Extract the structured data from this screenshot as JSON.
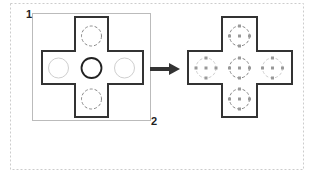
{
  "diagram": {
    "type": "before-after cross marquee selection",
    "colors": {
      "outline": "#333333",
      "frame": "#cccccc",
      "selection_rect": "#bbbbbb",
      "faded_circle": "#cfcfcf",
      "dashed_circle": "#888888",
      "grip": "#999999",
      "arrow": "#333333"
    },
    "corner_labels": {
      "start": "1",
      "end": "2"
    },
    "before": {
      "circles": [
        {
          "position": "top",
          "style": "dashed"
        },
        {
          "position": "left",
          "style": "faded"
        },
        {
          "position": "center",
          "style": "solid"
        },
        {
          "position": "right",
          "style": "faded"
        },
        {
          "position": "bottom",
          "style": "dashed"
        }
      ]
    },
    "after": {
      "circles": [
        {
          "position": "top",
          "style": "selected-with-grips"
        },
        {
          "position": "left",
          "style": "selected-with-grips"
        },
        {
          "position": "center",
          "style": "selected-with-grips"
        },
        {
          "position": "right",
          "style": "selected-with-grips"
        },
        {
          "position": "bottom",
          "style": "selected-with-grips"
        }
      ]
    },
    "arrow": {
      "direction": "right"
    }
  }
}
